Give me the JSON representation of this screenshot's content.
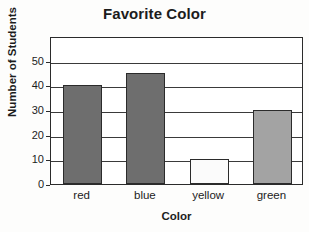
{
  "chart_data": {
    "type": "bar",
    "title": "Favorite Color",
    "xlabel": "Color",
    "ylabel": "Number of Students",
    "categories": [
      "red",
      "blue",
      "yellow",
      "green"
    ],
    "values": [
      40,
      45,
      10,
      30
    ],
    "bar_colors": [
      "#6e6e6e",
      "#6e6e6e",
      "#fbfbfb",
      "#a3a3a3"
    ],
    "ylim": [
      0,
      60
    ],
    "yticks": [
      0,
      10,
      20,
      30,
      40,
      50
    ],
    "ytick_labels": [
      "0",
      "10",
      "20",
      "30",
      "40",
      "50"
    ],
    "grid": "horizontal",
    "legend": "none",
    "series": [
      {
        "name": "Number of Students",
        "values": [
          40,
          45,
          10,
          30
        ]
      }
    ]
  }
}
